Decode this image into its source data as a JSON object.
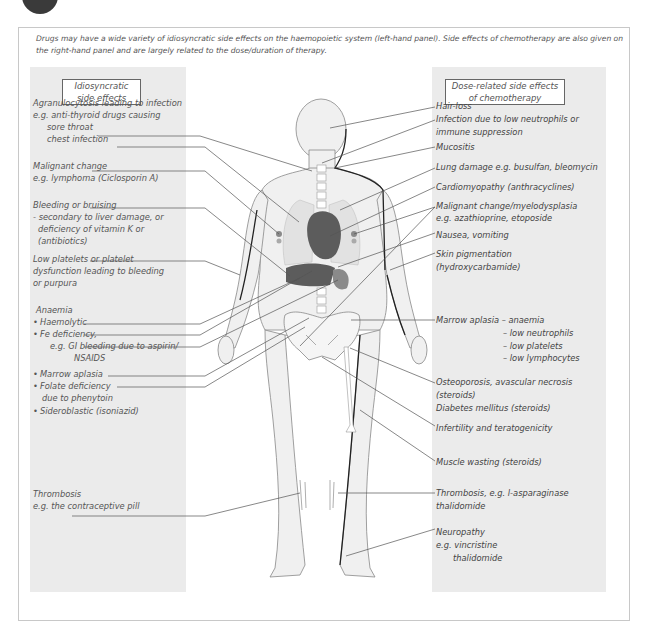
{
  "intro_text": "Drugs may have a wide variety of idiosyncratic side effects on the haemopoietic system (left-hand panel).  Side effects of chemotherapy are also given on the right-hand panel and are largely related to the dose/duration of therapy.",
  "left_panel": {
    "title_line1": "Idiosyncratic",
    "title_line2": "side effects",
    "labels": [
      "Agranulocytosis leading to infection",
      "e.g. anti-thyroid drugs causing",
      "sore throat",
      "chest infection",
      "Malignant change",
      "e.g. lymphoma (Ciclosporin A)",
      "Bleeding or bruising",
      "- secondary to liver damage, or",
      "deficiency of vitamin K or",
      "(antibiotics)",
      "Low platelets or platelet",
      "dysfunction leading to bleeding",
      "or purpura",
      "Anaemia",
      "Haemolytic",
      "Fe deficiency,",
      "e.g. GI bleeding due to aspirin/",
      "NSAIDS",
      "Marrow aplasia",
      "Folate deficiency",
      "due to phenytoin",
      "Sideroblastic (isoniazid)",
      "Thrombosis",
      "e.g. the contraceptive pill"
    ]
  },
  "right_panel": {
    "title_line1": "Dose-related side effects",
    "title_line2": "of chemotherapy",
    "labels": [
      "Hair-loss",
      "Infection due to low neutrophils or",
      "immune suppression",
      "Mucositis",
      "Lung damage e.g. busulfan, bleomycin",
      "Cardiomyopathy (anthracyclines)",
      "Malignant change/myelodysplasia",
      "e.g. azathioprine, etoposide",
      "Nausea, vomiting",
      "Skin pigmentation",
      "(hydroxycarbamide)",
      "Marrow aplasia  – anaemia",
      "– low neutrophils",
      "– low platelets",
      "– low lymphocytes",
      "Osteoporosis, avascular necrosis",
      "(steroids)",
      "Diabetes mellitus (steroids)",
      "Infertility and teratogenicity",
      "Muscle wasting (steroids)",
      "Thrombosis, e.g. l-asparaginase",
      "thalidomide",
      "Neuropathy",
      "e.g. vincristine",
      "thalidomide"
    ]
  },
  "colors": {
    "panel_bg": "#ebebeb",
    "body_fill": "#f0f0f0",
    "organ_dark": "#5c5c5c",
    "organ_mid": "#8a8a8a",
    "leader_line": "#555555"
  }
}
